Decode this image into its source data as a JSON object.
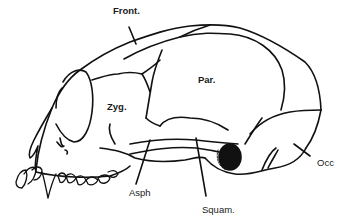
{
  "diagram": {
    "line_color": "#111111",
    "background": "#ffffff",
    "labels": [
      {
        "id": "front",
        "text": "Front.",
        "x": 113,
        "y": 14,
        "bold": true
      },
      {
        "id": "par",
        "text": "Par.",
        "x": 198,
        "y": 74,
        "bold": true
      },
      {
        "id": "zyg",
        "text": "Zyg.",
        "x": 107,
        "y": 103,
        "bold": true
      },
      {
        "id": "asph",
        "text": "Asph",
        "x": 129,
        "y": 189,
        "bold": false
      },
      {
        "id": "squam",
        "text": "Squam.",
        "x": 202,
        "y": 205,
        "bold": false
      },
      {
        "id": "occ",
        "text": "Occ",
        "x": 317,
        "y": 153,
        "bold": false
      }
    ]
  }
}
